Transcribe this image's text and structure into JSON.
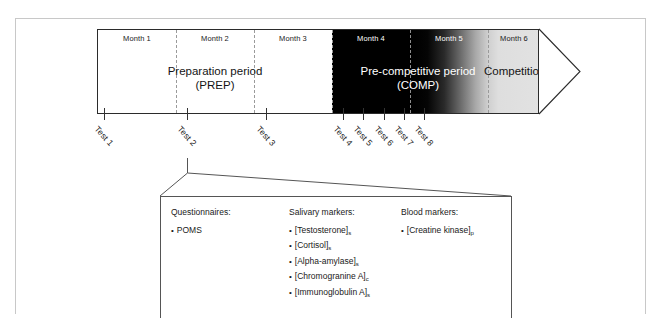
{
  "figure": {
    "type": "study-design-timeline"
  },
  "timeline": {
    "months": [
      {
        "label": "Month 1",
        "tone": "dark"
      },
      {
        "label": "Month 2",
        "tone": "dark"
      },
      {
        "label": "Month 3",
        "tone": "dark"
      },
      {
        "label": "Month 4",
        "tone": "light"
      },
      {
        "label": "Month 5",
        "tone": "light"
      },
      {
        "label": "Month 6",
        "tone": "dark"
      }
    ],
    "phases": [
      {
        "line1": "Preparation period",
        "line2": "(PREP)",
        "tone": "dark"
      },
      {
        "line1": "Pre-competitive period",
        "line2": "(COMP)",
        "tone": "light"
      },
      {
        "line1": "Competitions",
        "line2": "",
        "tone": "dark"
      }
    ]
  },
  "tests": [
    {
      "label": "Test 1"
    },
    {
      "label": "Test 2"
    },
    {
      "label": "Test 3"
    },
    {
      "label": "Test 4"
    },
    {
      "label": "Test 5"
    },
    {
      "label": "Test 6"
    },
    {
      "label": "Test 7"
    },
    {
      "label": "Test 8"
    }
  ],
  "detail_box": {
    "columns": [
      {
        "heading": "Questionnaires:",
        "items": [
          {
            "text": "POMS",
            "sub": ""
          }
        ]
      },
      {
        "heading": "Salivary markers:",
        "items": [
          {
            "text": "[Testosterone]",
            "sub": "s"
          },
          {
            "text": "[Cortisol]",
            "sub": "s"
          },
          {
            "text": "[Alpha-amylase]",
            "sub": "s"
          },
          {
            "text": "[Chromogranine A]",
            "sub": "c"
          },
          {
            "text": "[Immunoglobulin A]",
            "sub": "s"
          }
        ]
      },
      {
        "heading": "Blood markers:",
        "items": [
          {
            "text": "[Creatine kinase]",
            "sub": "p"
          }
        ]
      }
    ]
  },
  "colors": {
    "ink": "#1a1a1a",
    "frame": "#c8c8c8",
    "band_border": "#2b2b2b",
    "dark_zone": "#000000",
    "competition_zone": "#e2e2e2",
    "divider": "#9a9a9a"
  }
}
